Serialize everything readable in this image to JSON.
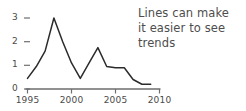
{
  "chart_data": {
    "type": "line",
    "title": "",
    "xlabel": "",
    "ylabel": "",
    "xlim": [
      1995,
      2010
    ],
    "ylim": [
      0,
      3.15
    ],
    "grid": false,
    "legend": null,
    "x_ticks": [
      1995,
      2000,
      2005,
      2010
    ],
    "x_tick_labels": [
      "1995",
      "2000",
      "2005",
      "2010"
    ],
    "y_ticks": [
      0,
      1,
      2,
      3
    ],
    "y_tick_labels": [
      "0",
      "1",
      "2",
      "3"
    ],
    "line_color": "#2b2b2b",
    "series": [
      {
        "name": "trend",
        "x": [
          1995,
          1996,
          1997,
          1998,
          1999,
          2000,
          2001,
          2002,
          2003,
          2004,
          2005,
          2006,
          2007,
          2008,
          2009
        ],
        "values": [
          0.45,
          0.95,
          1.6,
          3.0,
          2.0,
          1.1,
          0.45,
          1.1,
          1.75,
          0.95,
          0.9,
          0.9,
          0.4,
          0.2,
          0.2
        ]
      }
    ],
    "annotations": [
      {
        "name": "trend-note",
        "text": "Lines can make it easier to see trends",
        "lines": [
          "Lines can make",
          "it easier to see",
          "trends"
        ],
        "position": "right"
      }
    ]
  },
  "annotation": {
    "line1": "Lines can make",
    "line2": "it easier to see",
    "line3": "trends"
  },
  "axis": {
    "y_labels": [
      "3",
      "2",
      "1",
      "0"
    ],
    "x_labels": [
      "1995",
      "2000",
      "2005",
      "2010"
    ]
  },
  "colors": {
    "line": "#2b2b2b",
    "axis": "#6e6e6e",
    "text": "#4a4a4a",
    "background": "#ffffff"
  }
}
